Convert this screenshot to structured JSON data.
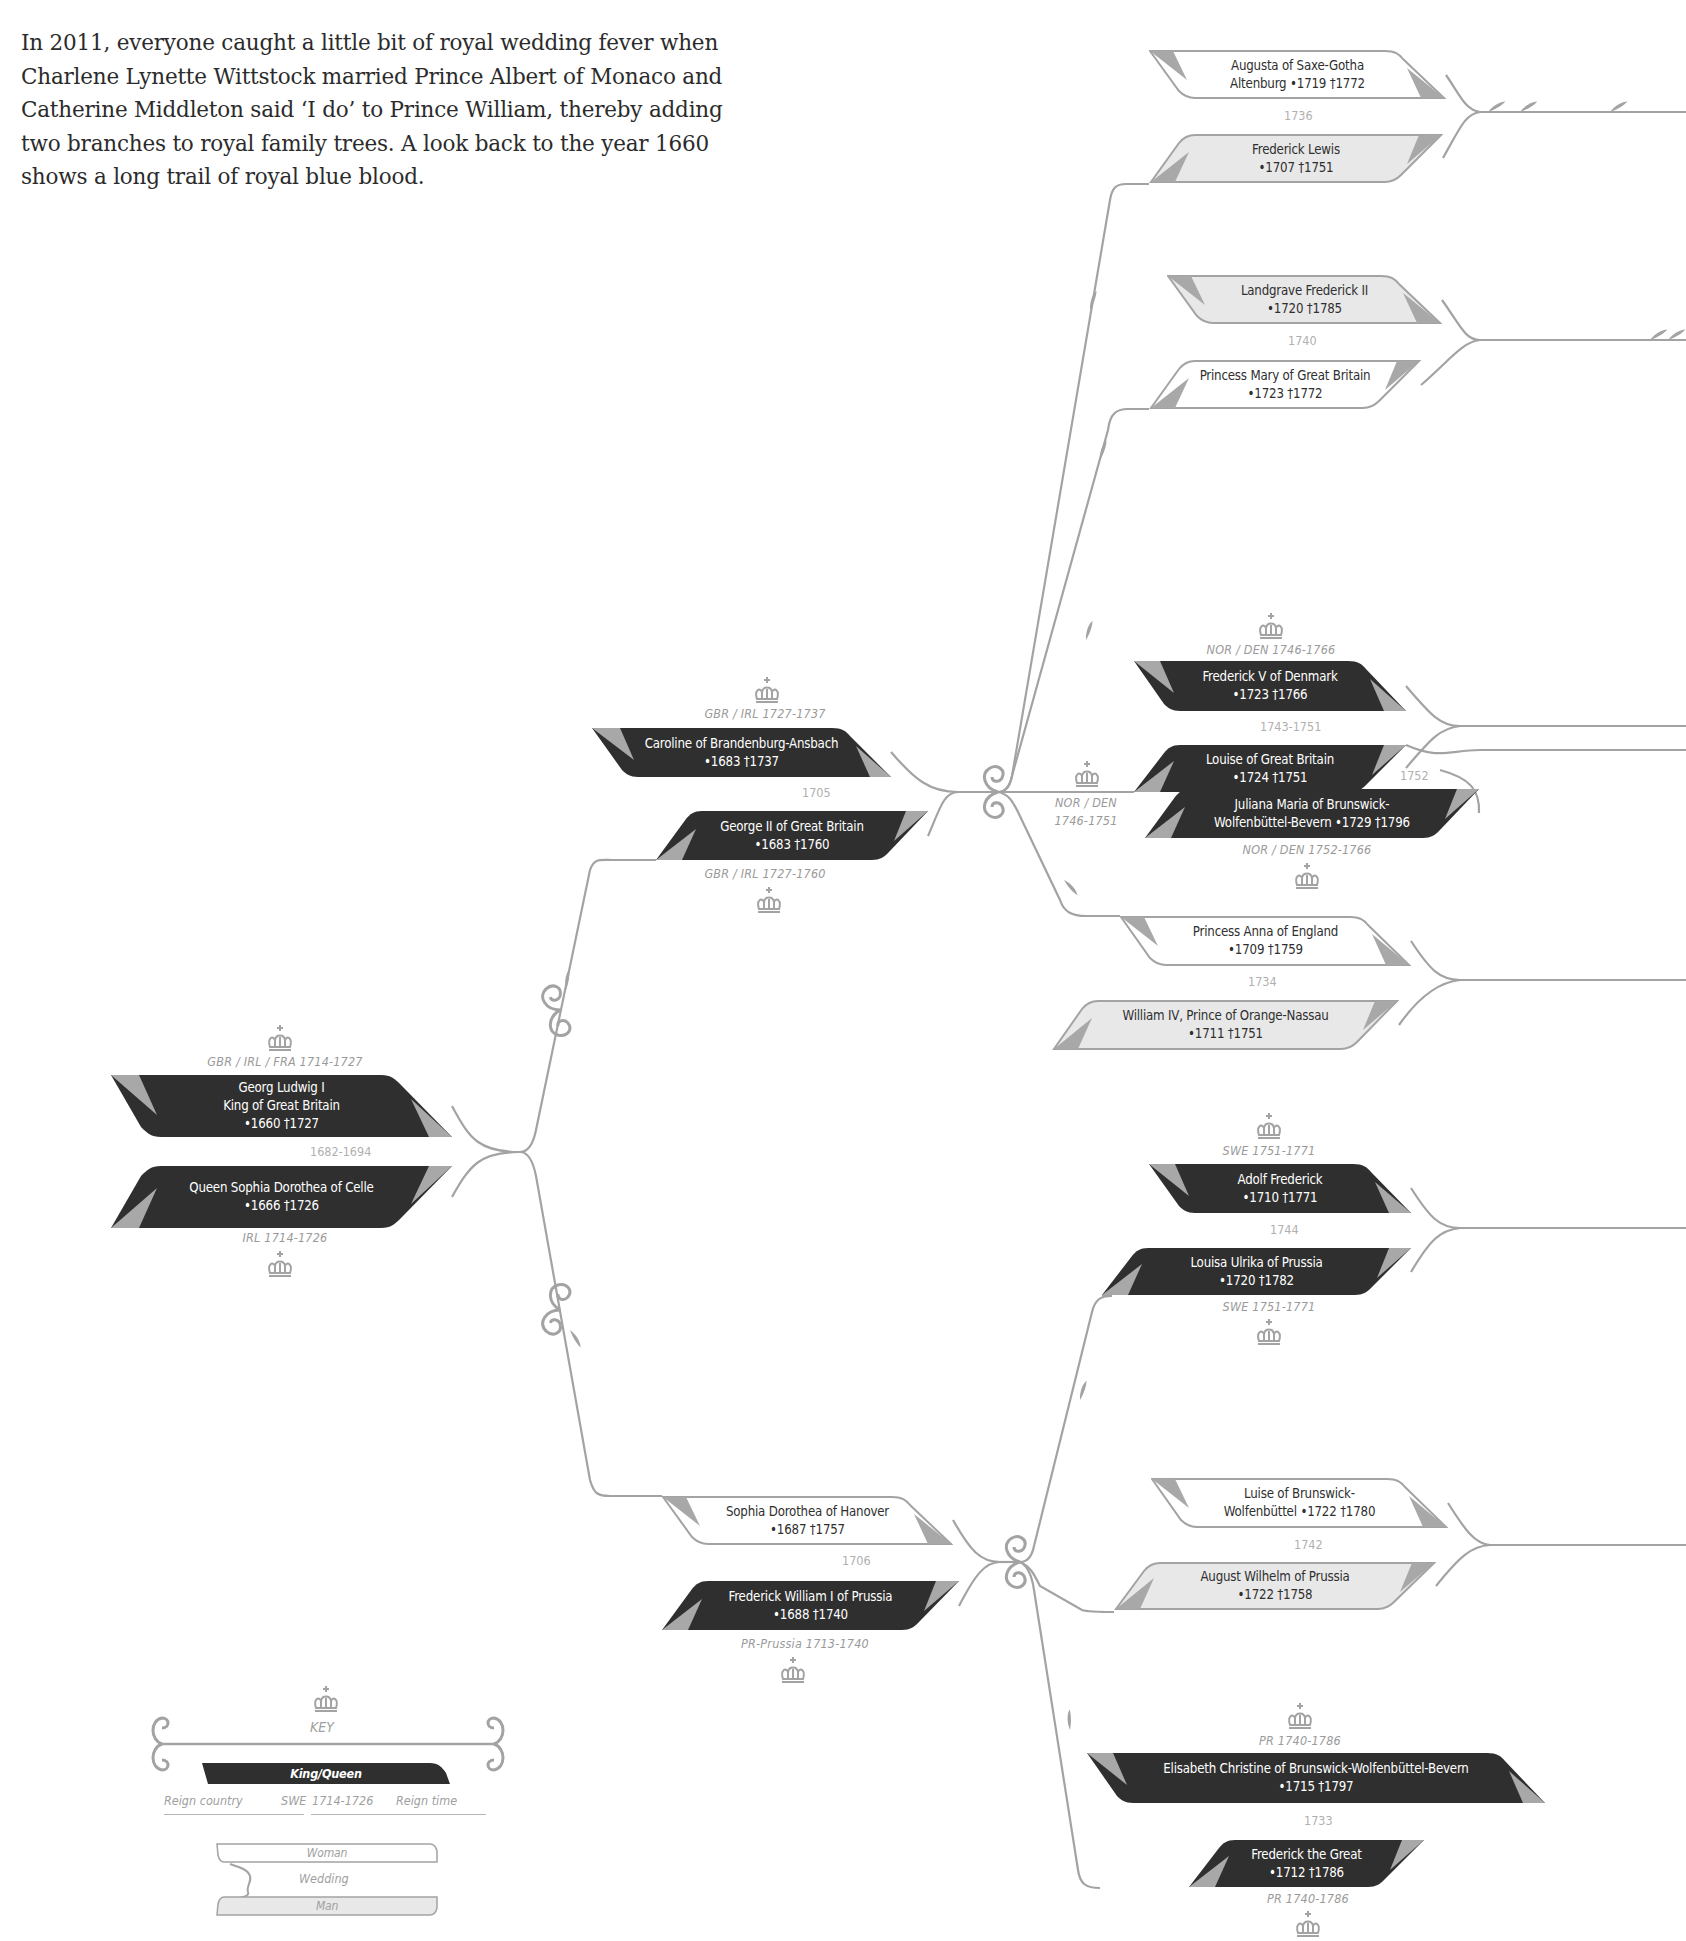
{
  "intro": {
    "lines": [
      "In 2011, everyone caught a little bit of royal wedding fever when",
      "Charlene Lynette Wittstock married Prince Albert of Monaco and",
      "Catherine Middleton said ‘I do’ to Prince William, thereby adding",
      "two branches to royal family trees. A look back to the year 1660",
      "shows a long trail of royal blue blood."
    ]
  },
  "colors": {
    "royal_fill": "#2f2f2f",
    "woman_fill": "#ffffff",
    "man_fill": "#e8e8e8",
    "corner_tab": "#a8a8a8",
    "line": "#a3a3a3",
    "muted_text": "#9a9a9a"
  },
  "couples": {
    "georg_ludwig": {
      "top": {
        "line1": "Georg Ludwig I",
        "line2": "King of Great Britain",
        "line3": "•1660  †1727",
        "type": "royal",
        "reign": "GBR / IRL / FRA 1714-1727"
      },
      "wedding": "1682-1694",
      "bottom": {
        "line1": "Queen Sophia Dorothea of Celle",
        "line2": "•1666  †1726",
        "type": "royal",
        "reign": "IRL 1714-1726"
      }
    },
    "george_ii": {
      "top": {
        "line1": "Caroline of Brandenburg-Ansbach",
        "line2": "•1683  †1737",
        "type": "royal",
        "reign": "GBR / IRL  1727-1737"
      },
      "wedding": "1705",
      "bottom": {
        "line1": "George II of Great Britain",
        "line2": "•1683  †1760",
        "type": "royal",
        "reign": "GBR / IRL 1727-1760"
      }
    },
    "frederick_wilhelm": {
      "top": {
        "line1": "Sophia Dorothea of Hanover",
        "line2": "•1687  †1757",
        "type": "woman"
      },
      "wedding": "1706",
      "bottom": {
        "line1": "Frederick William I of Prussia",
        "line2": "•1688  †1740",
        "type": "royal",
        "reign": "PR-Prussia 1713-1740"
      }
    },
    "frederick_lewis": {
      "top": {
        "line1": "Augusta of Saxe-Gotha",
        "line2": "Altenburg   •1719  †1772",
        "type": "woman"
      },
      "wedding": "1736",
      "bottom": {
        "line1": "Frederick Lewis",
        "line2": "•1707  †1751",
        "type": "man"
      }
    },
    "landgrave": {
      "top": {
        "line1": "Landgrave Frederick II",
        "line2": "•1720  †1785",
        "type": "man"
      },
      "wedding": "1740",
      "bottom": {
        "line1": "Princess Mary of Great Britain",
        "line2": "•1723  †1772",
        "type": "woman"
      }
    },
    "frederick_v": {
      "top": {
        "line1": "Frederick V of Denmark",
        "line2": "•1723  †1766",
        "type": "royal",
        "reign": "NOR / DEN  1746-1766"
      },
      "wedding": "1743-1751",
      "bottom": {
        "line1": "Louise of Great Britain",
        "line2": "•1724  †1751",
        "type": "royal",
        "reign_left_1": "NOR / DEN",
        "reign_left_2": "1746-1751"
      },
      "second_wedding": "1752",
      "second": {
        "line1": "Juliana Maria of Brunswick-",
        "line2": "Wolfenbüttel-Bevern •1729  †1796",
        "type": "royal",
        "reign": "NOR / DEN  1752-1766"
      }
    },
    "william_iv": {
      "top": {
        "line1": "Princess Anna of England",
        "line2": "•1709  †1759",
        "type": "woman"
      },
      "wedding": "1734",
      "bottom": {
        "line1": "William IV, Prince of Orange-Nassau",
        "line2": "•1711  †1751",
        "type": "man"
      }
    },
    "adolf_frederick": {
      "top": {
        "line1": "Adolf Frederick",
        "line2": "•1710  †1771",
        "type": "royal",
        "reign": "SWE 1751-1771"
      },
      "wedding": "1744",
      "bottom": {
        "line1": "Louisa Ulrika of Prussia",
        "line2": "•1720  †1782",
        "type": "royal",
        "reign": "SWE 1751-1771"
      }
    },
    "august_wilhelm": {
      "top": {
        "line1": "Luise of Brunswick-",
        "line2": "Wolfenbüttel   •1722  †1780",
        "type": "woman"
      },
      "wedding": "1742",
      "bottom": {
        "line1": "August Wilhelm of Prussia",
        "line2": "•1722  †1758",
        "type": "man"
      }
    },
    "frederick_great": {
      "top": {
        "line1": "Elisabeth Christine of Brunswick-Wolfenbüttel-Bevern",
        "line2": "•1715  †1797",
        "type": "royal",
        "reign": "PR  1740-1786"
      },
      "wedding": "1733",
      "bottom": {
        "line1": "Frederick the Great",
        "line2": "•1712  †1786",
        "type": "royal",
        "reign": "PR  1740-1786"
      }
    }
  },
  "key": {
    "title": "KEY",
    "royal_label": "King/Queen",
    "reign_country_label": "Reign country",
    "country_example": "SWE",
    "time_example": "1714-1726",
    "reign_time_label": "Reign time",
    "woman_label": "Woman",
    "wedding_label": "Wedding",
    "man_label": "Man"
  },
  "icons": {
    "crown": "crown-icon",
    "wedding_flourish": "wedding-flourish-icon",
    "leaf": "leaf-ornament-icon",
    "scroll": "scroll-ornament-icon"
  }
}
